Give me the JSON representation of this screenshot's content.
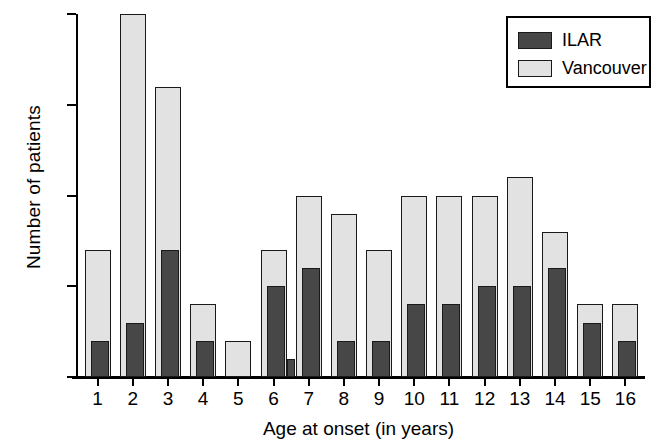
{
  "chart_data": {
    "type": "bar",
    "title": "",
    "xlabel": "Age at onset (in years)",
    "ylabel": "Number of patients",
    "categories": [
      "1",
      "2",
      "3",
      "4",
      "5",
      "6",
      "7",
      "8",
      "9",
      "10",
      "11",
      "12",
      "13",
      "14",
      "15",
      "16"
    ],
    "series": [
      {
        "name": "ILAR",
        "color": "#474747",
        "values": [
          2,
          3,
          7,
          2,
          0,
          5,
          6,
          2,
          2,
          4,
          4,
          5,
          5,
          6,
          3,
          2
        ]
      },
      {
        "name": "Vancouver",
        "color": "#e2e2e2",
        "values": [
          7,
          20,
          16,
          4,
          2,
          7,
          10,
          9,
          7,
          10,
          10,
          10,
          11,
          8,
          4,
          4
        ]
      }
    ],
    "extra_bars": [
      {
        "series": "ILAR",
        "category": "7",
        "value": 1,
        "note": "small separate ILAR bar left of age 7 pair"
      }
    ],
    "ylim": [
      0,
      20
    ],
    "yticks": [
      0,
      5,
      10,
      15,
      20
    ],
    "ytick_labels": [
      "0",
      "5",
      "10",
      "15",
      "20"
    ],
    "grid": false,
    "legend_position": "top-right"
  },
  "legend": {
    "entries": [
      {
        "label": "ILAR"
      },
      {
        "label": "Vancouver"
      }
    ]
  }
}
